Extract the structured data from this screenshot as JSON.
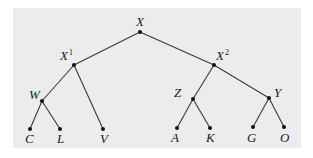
{
  "diagram": {
    "type": "tree",
    "colors": {
      "panel": "#ececec",
      "edge": "#3a3a3a",
      "node": "#111111",
      "text": "#1a1a1a"
    },
    "nodes": {
      "X": {
        "label": "X",
        "sup": ""
      },
      "X1": {
        "label": "X",
        "sup": "1"
      },
      "X2": {
        "label": "X",
        "sup": "2"
      },
      "W": {
        "label": "W",
        "sup": ""
      },
      "Z": {
        "label": "Z",
        "sup": ""
      },
      "Y": {
        "label": "Y",
        "sup": ""
      },
      "C": {
        "label": "C",
        "sup": ""
      },
      "L": {
        "label": "L",
        "sup": ""
      },
      "V": {
        "label": "V",
        "sup": ""
      },
      "A": {
        "label": "A",
        "sup": ""
      },
      "K": {
        "label": "K",
        "sup": ""
      },
      "G": {
        "label": "G",
        "sup": ""
      },
      "O": {
        "label": "O",
        "sup": ""
      }
    },
    "edges": [
      [
        "X",
        "X1"
      ],
      [
        "X",
        "X2"
      ],
      [
        "X1",
        "W"
      ],
      [
        "X1",
        "V"
      ],
      [
        "W",
        "C"
      ],
      [
        "W",
        "L"
      ],
      [
        "X2",
        "Z"
      ],
      [
        "X2",
        "Y"
      ],
      [
        "Z",
        "A"
      ],
      [
        "Z",
        "K"
      ],
      [
        "Y",
        "G"
      ],
      [
        "Y",
        "O"
      ]
    ]
  }
}
